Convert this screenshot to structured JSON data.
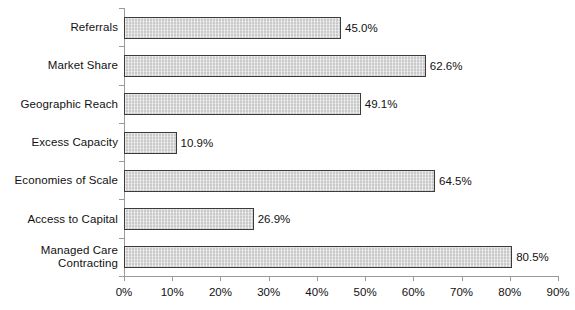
{
  "chart_data": {
    "type": "bar",
    "orientation": "horizontal",
    "title": "",
    "subtitle": "",
    "xlabel": "",
    "ylabel": "",
    "categories": [
      "Referrals",
      "Market Share",
      "Geographic Reach",
      "Excess Capacity",
      "Economies of Scale",
      "Access to Capital",
      "Managed Care\nContracting"
    ],
    "values": [
      45.0,
      62.6,
      49.1,
      10.9,
      64.5,
      26.9,
      80.5
    ],
    "data_labels": [
      "45.0%",
      "62.6%",
      "49.1%",
      "10.9%",
      "64.5%",
      "26.9%",
      "80.5%"
    ],
    "xlim": [
      0,
      90
    ],
    "x_tick_values": [
      0,
      10,
      20,
      30,
      40,
      50,
      60,
      70,
      80,
      90
    ],
    "x_tick_labels": [
      "0%",
      "10%",
      "20%",
      "30%",
      "40%",
      "50%",
      "60%",
      "70%",
      "80%",
      "90%"
    ],
    "grid": false,
    "legend": false,
    "bar_fill_color": "#c9c9c9",
    "bar_border_color": "#3b3b3b",
    "axis_color": "#9a9a9a",
    "text_color": "#111111",
    "background_color": "#ffffff"
  }
}
